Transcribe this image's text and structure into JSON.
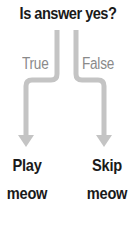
{
  "diagram": {
    "title": "Is answer yes?",
    "branches": [
      {
        "label": "True",
        "outcome": [
          "Play",
          "meow"
        ]
      },
      {
        "label": "False",
        "outcome": [
          "Skip",
          "meow"
        ]
      }
    ],
    "colors": {
      "arrow": "#c4c4c4",
      "title_text": "#1a1a1a",
      "branch_text": "#8a8a8a"
    }
  }
}
